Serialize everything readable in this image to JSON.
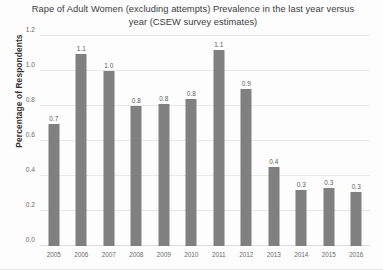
{
  "chart_data": {
    "type": "bar",
    "title": "Rape of Adult Women (excluding attempts) Prevalence in the last year versus year (CSEW survey estimates)",
    "xlabel": "",
    "ylabel": "Percentage of Respondents",
    "categories": [
      "2005",
      "2006",
      "2007",
      "2008",
      "2009",
      "2010",
      "2011",
      "2012",
      "2013",
      "2014",
      "2015",
      "2016"
    ],
    "values": [
      0.7,
      1.1,
      1.0,
      0.8,
      0.81,
      0.84,
      1.12,
      0.9,
      0.45,
      0.32,
      0.33,
      0.31
    ],
    "data_labels": [
      "0.7",
      "1.1",
      "1.0",
      "0.8",
      "0.8",
      "0.8",
      "1.1",
      "0.9",
      "0.4",
      "0.3",
      "0.3",
      "0.3"
    ],
    "ylim": [
      0.0,
      1.2
    ],
    "yticks": [
      0.0,
      0.2,
      0.4,
      0.6,
      0.8,
      1.0,
      1.2
    ],
    "ytick_labels": [
      "0.0",
      "0.2",
      "0.4",
      "0.6",
      "0.8",
      "1.0",
      "1.2"
    ],
    "grid": true,
    "legend": false,
    "bar_color": "#808080",
    "grid_color": "#e9e9e9"
  }
}
